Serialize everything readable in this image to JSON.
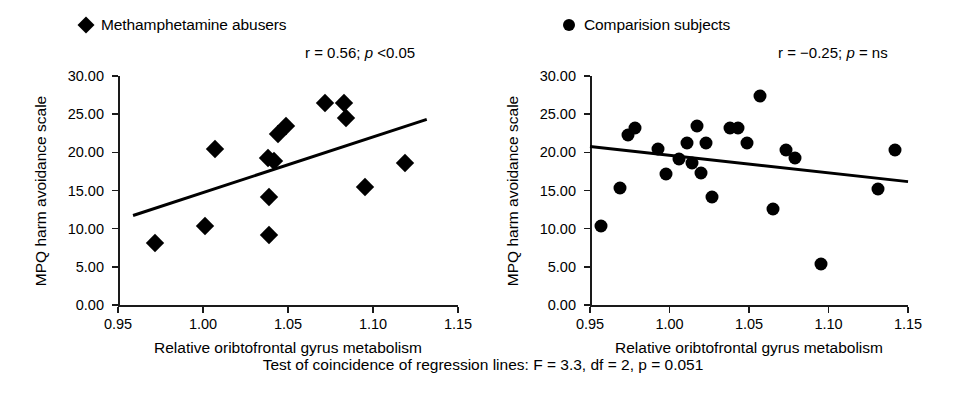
{
  "caption": "Test of coincidence of regression lines: F = 3.3, df = 2, p = 0.051",
  "axes": {
    "xlabel": "Relative oribtofrontal gyrus metabolism",
    "ylabel": "MPQ harm avoidance scale",
    "xticks": [
      "0.95",
      "1.00",
      "1.05",
      "1.10",
      "1.15"
    ],
    "yticks": [
      "30.00",
      "25.00",
      "20.00",
      "15.00",
      "10.00",
      "5.00",
      "0.00"
    ]
  },
  "panels": [
    {
      "id": "methamphetamine",
      "legend_label": "Methamphetamine abusers",
      "marker": "diamond",
      "stats_r": "r = 0.56;",
      "stats_p_italic": "p",
      "stats_p_rest": " <0.05"
    },
    {
      "id": "comparison",
      "legend_label": "Comparision subjects",
      "marker": "circle",
      "stats_r": "r = −0.25;",
      "stats_p_italic": "p",
      "stats_p_rest": " = ns"
    }
  ],
  "chart_data": [
    {
      "type": "scatter",
      "title": "Methamphetamine abusers",
      "xlabel": "Relative oribtofrontal gyrus metabolism",
      "ylabel": "MPQ harm avoidance scale",
      "xlim": [
        0.95,
        1.15
      ],
      "ylim": [
        0.0,
        30.0
      ],
      "xticks": [
        0.95,
        1.0,
        1.05,
        1.1,
        1.15
      ],
      "yticks": [
        0.0,
        5.0,
        10.0,
        15.0,
        20.0,
        25.0,
        30.0
      ],
      "grid": false,
      "legend": "top-left",
      "marker": "diamond",
      "annotation": "r = 0.56; p <0.05",
      "r": 0.56,
      "p": "<0.05",
      "points": [
        {
          "x": 0.972,
          "y": 8.1
        },
        {
          "x": 1.001,
          "y": 10.3
        },
        {
          "x": 1.007,
          "y": 20.5
        },
        {
          "x": 1.039,
          "y": 9.2
        },
        {
          "x": 1.039,
          "y": 14.1
        },
        {
          "x": 1.038,
          "y": 19.3
        },
        {
          "x": 1.042,
          "y": 18.8
        },
        {
          "x": 1.044,
          "y": 22.4
        },
        {
          "x": 1.049,
          "y": 23.4
        },
        {
          "x": 1.072,
          "y": 26.4
        },
        {
          "x": 1.083,
          "y": 26.4
        },
        {
          "x": 1.084,
          "y": 24.5
        },
        {
          "x": 1.095,
          "y": 15.4
        },
        {
          "x": 1.119,
          "y": 18.6
        }
      ],
      "regression_line": {
        "x0": 0.959,
        "y0": 11.9,
        "x1": 1.132,
        "y1": 24.5
      }
    },
    {
      "type": "scatter",
      "title": "Comparision subjects",
      "xlabel": "Relative oribtofrontal gyrus metabolism",
      "ylabel": "MPQ harm avoidance scale",
      "xlim": [
        0.95,
        1.15
      ],
      "ylim": [
        0.0,
        30.0
      ],
      "xticks": [
        0.95,
        1.0,
        1.05,
        1.1,
        1.15
      ],
      "yticks": [
        0.0,
        5.0,
        10.0,
        15.0,
        20.0,
        25.0,
        30.0
      ],
      "grid": false,
      "legend": "top-left",
      "marker": "circle",
      "annotation": "r = −0.25; p = ns",
      "r": -0.25,
      "p": "ns",
      "points": [
        {
          "x": 0.957,
          "y": 10.4
        },
        {
          "x": 0.969,
          "y": 15.3
        },
        {
          "x": 0.974,
          "y": 22.3
        },
        {
          "x": 0.978,
          "y": 23.2
        },
        {
          "x": 0.993,
          "y": 20.5
        },
        {
          "x": 0.998,
          "y": 17.2
        },
        {
          "x": 1.006,
          "y": 19.1
        },
        {
          "x": 1.011,
          "y": 21.2
        },
        {
          "x": 1.014,
          "y": 18.6
        },
        {
          "x": 1.017,
          "y": 23.4
        },
        {
          "x": 1.02,
          "y": 17.3
        },
        {
          "x": 1.023,
          "y": 21.2
        },
        {
          "x": 1.027,
          "y": 14.2
        },
        {
          "x": 1.038,
          "y": 23.2
        },
        {
          "x": 1.043,
          "y": 23.2
        },
        {
          "x": 1.049,
          "y": 21.2
        },
        {
          "x": 1.057,
          "y": 27.4
        },
        {
          "x": 1.065,
          "y": 12.6
        },
        {
          "x": 1.073,
          "y": 20.3
        },
        {
          "x": 1.079,
          "y": 19.3
        },
        {
          "x": 1.095,
          "y": 5.4
        },
        {
          "x": 1.131,
          "y": 15.2
        },
        {
          "x": 1.142,
          "y": 20.3
        }
      ],
      "regression_line": {
        "x0": 0.95,
        "y0": 21.0,
        "x1": 1.15,
        "y1": 16.4
      }
    }
  ]
}
